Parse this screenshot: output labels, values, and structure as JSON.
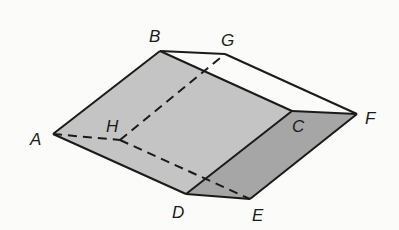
{
  "diagram": {
    "type": "triangular-prism",
    "colors": {
      "background": "#fbfbf9",
      "face_front": "#c4c4c4",
      "face_end": "#a6a6a6",
      "face_top": "#fbfbf9",
      "edge": "#1a1a1a"
    },
    "vertices": {
      "A": {
        "label": "A",
        "x": 53,
        "y": 134
      },
      "B": {
        "label": "B",
        "x": 160,
        "y": 51
      },
      "C": {
        "label": "C",
        "x": 292,
        "y": 111
      },
      "D": {
        "label": "D",
        "x": 186,
        "y": 194
      },
      "E": {
        "label": "E",
        "x": 250,
        "y": 199
      },
      "F": {
        "label": "F",
        "x": 357,
        "y": 114
      },
      "G": {
        "label": "G",
        "x": 225,
        "y": 54
      },
      "H": {
        "label": "H",
        "x": 120,
        "y": 140
      }
    },
    "solid_edges": [
      "AB",
      "BC",
      "CD",
      "DA",
      "BG",
      "GF",
      "CF",
      "FE",
      "DE"
    ],
    "hidden_edges": [
      "AH",
      "HE",
      "HG"
    ]
  }
}
